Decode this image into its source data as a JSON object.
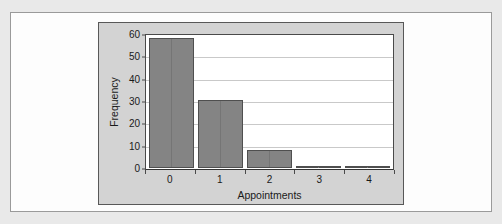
{
  "chart_data": {
    "type": "bar",
    "title": "",
    "categories": [
      "0",
      "1",
      "2",
      "3",
      "4"
    ],
    "values": [
      59,
      31,
      8,
      1,
      1
    ],
    "xlabel": "Appointments",
    "ylabel": "Frequency",
    "ylim": [
      0,
      60
    ],
    "yticks": [
      0,
      10,
      20,
      30,
      40,
      50,
      60
    ],
    "ytick_labels": [
      "0",
      "10",
      "20",
      "30",
      "40",
      "50",
      "60"
    ],
    "grid": true,
    "grid_axis": "y",
    "legend": false,
    "legend_position": "none",
    "series": [
      {
        "name": "Frequency",
        "values": [
          59,
          31,
          8,
          1,
          1
        ]
      }
    ]
  },
  "style": {
    "bar_fill": "#848484",
    "bar_border": "#4f4f4f",
    "panel_background": "#d3d3d3",
    "plot_background": "#ffffff",
    "gridline_color": "#c9c9c9",
    "axis_color": "#4a4a4a",
    "text_color": "#1a1a1a",
    "page_background": "#e9e9e9",
    "card_background": "#fdfdfd"
  }
}
